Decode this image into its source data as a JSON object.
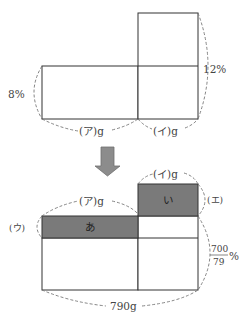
{
  "top_diagram": {
    "left_percent": "8%",
    "right_percent": "12%",
    "left_weight": "(ア)g",
    "right_weight": "(イ)g"
  },
  "arrow": {
    "direction": "down",
    "color": "#8c8c8c"
  },
  "bottom_diagram": {
    "top_weight": "(イ)g",
    "left_top_weight": "(ア)g",
    "left_label": "(ウ)",
    "right_label": "(エ)",
    "shaded_left": "あ",
    "shaded_right": "い",
    "result_percent_numerator": "700",
    "result_percent_denominator": "79",
    "result_percent_unit": "%",
    "total_weight": "790g",
    "shade_color": "#7a7a7a"
  }
}
